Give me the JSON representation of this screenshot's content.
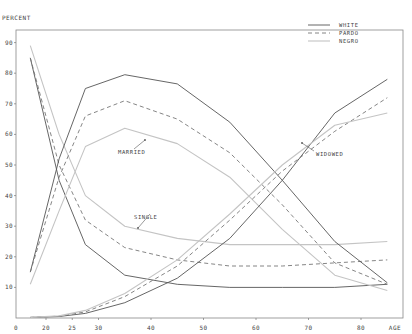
{
  "chart_data": {
    "type": "line",
    "title": "",
    "ylabel": "PERCENT",
    "xlabel": "AGE",
    "ylim": [
      0,
      100
    ],
    "xlim": [
      15,
      88
    ],
    "grid": false,
    "legend_position": "top-right",
    "x_ticks": [
      0,
      20,
      25,
      30,
      40,
      50,
      60,
      70,
      80
    ],
    "y_ticks": [
      10,
      20,
      30,
      40,
      50,
      60,
      70,
      80,
      90
    ],
    "legend": [
      {
        "name": "WHITE",
        "style": "solid",
        "color": "#555555"
      },
      {
        "name": "PARDO",
        "style": "dashed",
        "color": "#777777"
      },
      {
        "name": "NEGRO",
        "style": "solid-light",
        "color": "#bbbbbb"
      }
    ],
    "annotations": [
      {
        "text": "MARRIED",
        "x": 118,
        "y": 154,
        "arrow_to": [
          145,
          140
        ]
      },
      {
        "text": "SINGLE",
        "x": 134,
        "y": 219,
        "arrow_to": [
          138,
          228
        ]
      },
      {
        "text": "WIDOWED",
        "x": 316,
        "y": 156,
        "arrow_to": [
          302,
          143
        ]
      }
    ],
    "x": [
      17,
      22.5,
      27.5,
      35,
      45,
      55,
      65,
      75,
      85
    ],
    "series": [
      {
        "group": "SINGLE",
        "name": "WHITE",
        "values": [
          85,
          45,
          24,
          14,
          11,
          10,
          10,
          10,
          11
        ]
      },
      {
        "group": "SINGLE",
        "name": "PARDO",
        "values": [
          85,
          50,
          32,
          23,
          19,
          17,
          17,
          18,
          19
        ]
      },
      {
        "group": "SINGLE",
        "name": "NEGRO",
        "values": [
          89,
          60,
          40,
          30,
          26,
          24,
          24,
          24,
          25
        ]
      },
      {
        "group": "MARRIED",
        "name": "WHITE",
        "values": [
          15,
          52,
          75,
          79.5,
          76.5,
          64,
          45,
          25,
          11.5
        ]
      },
      {
        "group": "MARRIED",
        "name": "PARDO",
        "values": [
          15,
          46,
          66,
          71,
          65,
          54,
          37,
          18,
          11
        ]
      },
      {
        "group": "MARRIED",
        "name": "NEGRO",
        "values": [
          11,
          35,
          56,
          62,
          57,
          46,
          29,
          14,
          9
        ]
      },
      {
        "group": "WIDOWED",
        "name": "WHITE",
        "values": [
          0.2,
          0.5,
          1.5,
          5,
          13,
          26,
          45,
          67,
          78
        ]
      },
      {
        "group": "WIDOWED",
        "name": "PARDO",
        "values": [
          0.2,
          0.6,
          2,
          7,
          17,
          32,
          48,
          61,
          72
        ]
      },
      {
        "group": "WIDOWED",
        "name": "NEGRO",
        "values": [
          0.2,
          0.7,
          2.5,
          8,
          19,
          34,
          50,
          63,
          67
        ]
      }
    ]
  }
}
